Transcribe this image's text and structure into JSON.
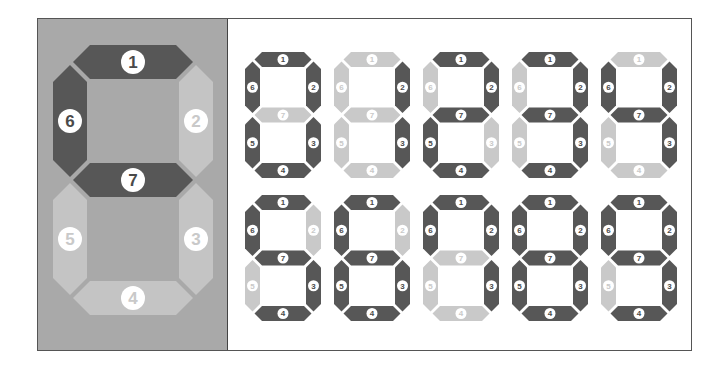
{
  "colors": {
    "segment_on": "#575757",
    "segment_off_small": "#c9c9c9",
    "segment_off_big": "#c4c4c4",
    "panel_bg": "#a9a9a9",
    "label_circle": "#ffffff",
    "label_text_on": "#4a4a4a",
    "label_text_off": "#c9c9c9"
  },
  "segment_labels": [
    "1",
    "2",
    "3",
    "4",
    "5",
    "6",
    "7"
  ],
  "big_digit": {
    "segments_on": [
      1,
      6,
      7
    ],
    "segments_off": [
      2,
      3,
      4,
      5
    ]
  },
  "digits": [
    {
      "row": 1,
      "col": 1,
      "represents": "0",
      "segments_on": [
        1,
        2,
        3,
        4,
        5,
        6
      ]
    },
    {
      "row": 1,
      "col": 2,
      "represents": "1",
      "segments_on": [
        2,
        3
      ]
    },
    {
      "row": 1,
      "col": 3,
      "represents": "2",
      "segments_on": [
        1,
        2,
        4,
        5,
        7
      ]
    },
    {
      "row": 1,
      "col": 4,
      "represents": "3",
      "segments_on": [
        1,
        2,
        3,
        4,
        7
      ]
    },
    {
      "row": 1,
      "col": 5,
      "represents": "4",
      "segments_on": [
        2,
        3,
        6,
        7
      ]
    },
    {
      "row": 2,
      "col": 1,
      "represents": "5",
      "segments_on": [
        1,
        3,
        4,
        6,
        7
      ]
    },
    {
      "row": 2,
      "col": 2,
      "represents": "6",
      "segments_on": [
        1,
        3,
        4,
        5,
        6,
        7
      ]
    },
    {
      "row": 2,
      "col": 3,
      "represents": "7",
      "segments_on": [
        1,
        2,
        3,
        6
      ]
    },
    {
      "row": 2,
      "col": 4,
      "represents": "8",
      "segments_on": [
        1,
        2,
        3,
        4,
        5,
        6,
        7
      ]
    },
    {
      "row": 2,
      "col": 5,
      "represents": "9",
      "segments_on": [
        1,
        2,
        3,
        4,
        6,
        7
      ]
    }
  ]
}
